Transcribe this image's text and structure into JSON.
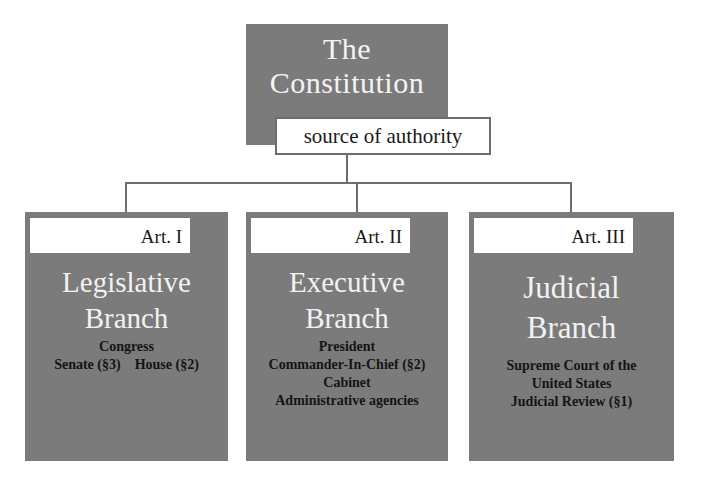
{
  "root": {
    "title_line1": "The",
    "title_line2": "Constitution",
    "label": "source of authority"
  },
  "colors": {
    "box_fill": "#7b7b7b",
    "title_text": "#f4f4f4",
    "label_fill": "#ffffff",
    "connector": "#6e6e6e",
    "detail_text": "#141414"
  },
  "branches": [
    {
      "article": "Art. I",
      "title_line1": "Legislative",
      "title_line2": "Branch",
      "details": {
        "line1": "Congress",
        "line2_left": "Senate (§3)",
        "line2_right": "House (§2)"
      }
    },
    {
      "article": "Art. II",
      "title_line1": "Executive",
      "title_line2": "Branch",
      "details": {
        "line1": "President",
        "line2": "Commander-In-Chief (§2)",
        "line3": "Cabinet",
        "line4": "Administrative agencies"
      }
    },
    {
      "article": "Art. III",
      "title_line1": "Judicial",
      "title_line2": "Branch",
      "details": {
        "line1": "Supreme Court of the",
        "line2": "United States",
        "line3": "Judicial Review (§1)"
      }
    }
  ]
}
